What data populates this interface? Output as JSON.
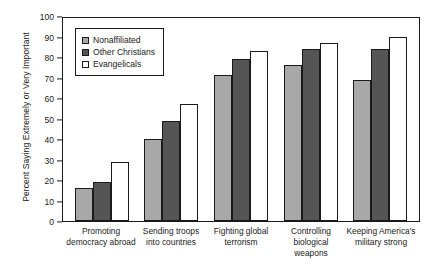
{
  "chart_data": {
    "type": "bar",
    "title": "",
    "xlabel": "",
    "ylabel": "Percent Saying Extremely or Very Important",
    "ylim": [
      0,
      100
    ],
    "ytick_step": 10,
    "grid": false,
    "legend_position": "top-left",
    "categories": [
      "Promoting\ndemocracy abroad",
      "Sending troops\ninto countries",
      "Fighting global\nterrorism",
      "Controlling\nbiological weapons",
      "Keeping America's\nmilitary strong"
    ],
    "yticks": [
      "0",
      "10",
      "20",
      "30",
      "40",
      "50",
      "60",
      "70",
      "80",
      "90",
      "100"
    ],
    "series": [
      {
        "name": "Nonaffiliated",
        "color": "#a8a8a8",
        "values": [
          16,
          40,
          71,
          76,
          69
        ]
      },
      {
        "name": "Other Christians",
        "color": "#555555",
        "values": [
          19,
          49,
          79,
          84,
          84
        ]
      },
      {
        "name": "Evangelicals",
        "color": "#ffffff",
        "values": [
          29,
          57,
          83,
          87,
          90
        ]
      }
    ]
  }
}
